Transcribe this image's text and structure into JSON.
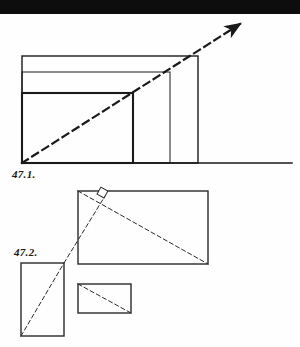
{
  "page": {
    "width": 300,
    "height": 347,
    "background_color": "#fefefe",
    "header_band_color": "#0d0d0d",
    "ink_color": "#1a1a1a"
  },
  "figures": [
    {
      "id": "fig-47-1",
      "label": "47.1.",
      "description": "Nested right-angled rectangles sharing a common bottom-left corner with a dashed diagonal ray carrying an arrowhead",
      "baseline": {
        "x1": 22,
        "y1": 163,
        "x2": 292,
        "y2": 163
      },
      "origin": {
        "x": 22,
        "y": 163
      },
      "rectangles": [
        {
          "name": "outer-rectangle",
          "x": 22,
          "y": 56,
          "width": 176,
          "height": 107,
          "stroke_width": 1.4
        },
        {
          "name": "middle-rectangle",
          "x": 22,
          "y": 72,
          "width": 148,
          "height": 91,
          "stroke_width": 1.0
        },
        {
          "name": "inner-rectangle",
          "x": 22,
          "y": 93,
          "width": 111,
          "height": 70,
          "stroke_width": 2.0
        }
      ],
      "diagonal": {
        "name": "dashed-diagonal-ray",
        "x1": 22,
        "y1": 163,
        "x2": 243,
        "y2": 22,
        "dash": "7 5",
        "stroke_width": 2.2,
        "arrowhead": true
      }
    },
    {
      "id": "fig-47-2",
      "label": "47.2.",
      "description": "Three similar rectangles arranged about a common dashed diagonal, with a right-angle square marker at the perpendicular vertex",
      "rectangles": [
        {
          "name": "tall-rectangle",
          "x": 21,
          "y": 263,
          "width": 43,
          "height": 73,
          "stroke_width": 1.4
        },
        {
          "name": "wide-rectangle",
          "x": 78,
          "y": 191,
          "width": 130,
          "height": 73,
          "stroke_width": 1.4
        },
        {
          "name": "small-rectangle",
          "x": 78,
          "y": 284,
          "width": 53,
          "height": 29,
          "stroke_width": 1.4
        }
      ],
      "diagonals": [
        {
          "name": "tall-rectangle-diagonal",
          "x1": 21,
          "y1": 336,
          "x2": 64,
          "y2": 263,
          "dash": "4 3",
          "stroke_width": 1.0
        },
        {
          "name": "long-dashed-ray",
          "x1": 64,
          "y1": 263,
          "x2": 104,
          "y2": 197,
          "dash": "4 3",
          "stroke_width": 1.0
        },
        {
          "name": "wide-rectangle-diagonal",
          "x1": 78,
          "y1": 191,
          "x2": 208,
          "y2": 264,
          "dash": "4 3",
          "stroke_width": 1.0
        },
        {
          "name": "small-rectangle-diagonal",
          "x1": 78,
          "y1": 284,
          "x2": 131,
          "y2": 313,
          "dash": "4 3",
          "stroke_width": 1.0
        }
      ],
      "right_angle_marker": {
        "name": "right-angle-square",
        "vertex_x": 104,
        "vertex_y": 198,
        "size": 8
      }
    }
  ]
}
